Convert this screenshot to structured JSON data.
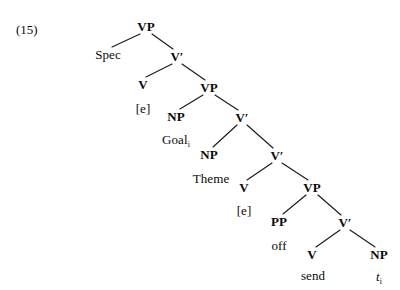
{
  "figure": {
    "example_number": "(15)",
    "caption": ""
  },
  "colors": {
    "background": "#ffffff",
    "text": "#0a0a0a",
    "line": "#1a1a1a"
  },
  "chart_data": {
    "type": "diagram",
    "diagram_kind": "syntax-tree",
    "title": "(15)",
    "nodes": [
      {
        "id": "vp1",
        "label": "VP",
        "kind": "category",
        "x": 146,
        "y": 26
      },
      {
        "id": "spec",
        "label": "Spec",
        "kind": "terminal",
        "x": 108,
        "y": 54
      },
      {
        "id": "vbar1",
        "label": "V′",
        "kind": "category",
        "x": 177,
        "y": 56
      },
      {
        "id": "v1",
        "label": "V",
        "kind": "category",
        "x": 143,
        "y": 84
      },
      {
        "id": "e1",
        "label": "[e]",
        "kind": "terminal",
        "x": 143,
        "y": 108
      },
      {
        "id": "vp2",
        "label": "VP",
        "kind": "category",
        "x": 209,
        "y": 87
      },
      {
        "id": "np1",
        "label": "NP",
        "kind": "category",
        "x": 176,
        "y": 116
      },
      {
        "id": "goal",
        "label": "Goal",
        "kind": "terminal",
        "x": 176,
        "y": 139,
        "subscript": "i"
      },
      {
        "id": "vbar2",
        "label": "V′",
        "kind": "category",
        "x": 242,
        "y": 117
      },
      {
        "id": "np2",
        "label": "NP",
        "kind": "category",
        "x": 209,
        "y": 154
      },
      {
        "id": "theme",
        "label": "Theme",
        "kind": "terminal",
        "x": 211,
        "y": 178
      },
      {
        "id": "vbar3",
        "label": "V′",
        "kind": "category",
        "x": 277,
        "y": 155
      },
      {
        "id": "v2",
        "label": "V",
        "kind": "category",
        "x": 244,
        "y": 187
      },
      {
        "id": "e2",
        "label": "[e]",
        "kind": "terminal",
        "x": 244,
        "y": 210
      },
      {
        "id": "vp3",
        "label": "VP",
        "kind": "category",
        "x": 312,
        "y": 187
      },
      {
        "id": "pp",
        "label": "PP",
        "kind": "category",
        "x": 279,
        "y": 221
      },
      {
        "id": "off",
        "label": "off",
        "kind": "terminal",
        "x": 279,
        "y": 245
      },
      {
        "id": "vbar4",
        "label": "V′",
        "kind": "category",
        "x": 345,
        "y": 222
      },
      {
        "id": "v3",
        "label": "V",
        "kind": "category",
        "x": 312,
        "y": 254
      },
      {
        "id": "send",
        "label": "send",
        "kind": "terminal",
        "x": 313,
        "y": 275
      },
      {
        "id": "np3",
        "label": "NP",
        "kind": "category",
        "x": 379,
        "y": 254
      },
      {
        "id": "trace",
        "label": "t",
        "kind": "terminal",
        "x": 379,
        "y": 276,
        "subscript": "i",
        "italic": true
      }
    ],
    "edges": [
      {
        "from": "vp1",
        "to": "spec",
        "x1": 140,
        "y1": 34,
        "x2": 112,
        "y2": 47
      },
      {
        "from": "vp1",
        "to": "vbar1",
        "x1": 152,
        "y1": 34,
        "x2": 173,
        "y2": 49
      },
      {
        "from": "vbar1",
        "to": "v1",
        "x1": 172,
        "y1": 64,
        "x2": 146,
        "y2": 77
      },
      {
        "from": "vbar1",
        "to": "vp2",
        "x1": 182,
        "y1": 64,
        "x2": 205,
        "y2": 80
      },
      {
        "from": "vp2",
        "to": "np1",
        "x1": 203,
        "y1": 95,
        "x2": 180,
        "y2": 109
      },
      {
        "from": "vp2",
        "to": "vbar2",
        "x1": 215,
        "y1": 95,
        "x2": 238,
        "y2": 110
      },
      {
        "from": "vbar2",
        "to": "np2",
        "x1": 237,
        "y1": 125,
        "x2": 213,
        "y2": 147
      },
      {
        "from": "vbar2",
        "to": "vbar3",
        "x1": 247,
        "y1": 125,
        "x2": 273,
        "y2": 148
      },
      {
        "from": "vbar3",
        "to": "v2",
        "x1": 272,
        "y1": 163,
        "x2": 247,
        "y2": 180
      },
      {
        "from": "vbar3",
        "to": "vp3",
        "x1": 282,
        "y1": 163,
        "x2": 308,
        "y2": 180
      },
      {
        "from": "vp3",
        "to": "pp",
        "x1": 306,
        "y1": 195,
        "x2": 283,
        "y2": 214
      },
      {
        "from": "vp3",
        "to": "vbar4",
        "x1": 318,
        "y1": 195,
        "x2": 341,
        "y2": 215
      },
      {
        "from": "vbar4",
        "to": "v3",
        "x1": 340,
        "y1": 230,
        "x2": 316,
        "y2": 247
      },
      {
        "from": "vbar4",
        "to": "np3",
        "x1": 350,
        "y1": 230,
        "x2": 375,
        "y2": 247
      }
    ],
    "structure_text": "[VP Spec [V' V[e] [VP NP Goal_i [V' NP Theme [V' V[e] [VP PP off [V' V send NP t_i ]]]]]]]"
  }
}
